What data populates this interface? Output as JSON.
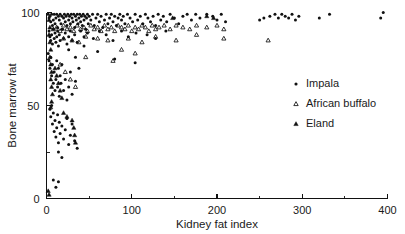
{
  "chart_data": {
    "type": "scatter",
    "title": "",
    "xlabel": "Kidney fat index",
    "ylabel": "Bone marrow fat",
    "xlim": [
      0,
      400
    ],
    "ylim": [
      0,
      100
    ],
    "xticks": [
      0,
      100,
      200,
      300,
      400
    ],
    "yticks": [
      0,
      50,
      100
    ],
    "xtick_labels": [
      "0",
      "100",
      "200",
      "300",
      "400"
    ],
    "ytick_labels": [
      "0",
      "50",
      "100"
    ],
    "x_minor_ticks": [
      50,
      150,
      250,
      350
    ],
    "y_minor_ticks": [
      25,
      75
    ],
    "grid": false,
    "legend_position": "center-right",
    "series": [
      {
        "name": "Impala",
        "marker": "filled-circle",
        "color": "#111111",
        "points": [
          [
            2,
            99
          ],
          [
            3,
            97
          ],
          [
            4,
            98
          ],
          [
            5,
            95
          ],
          [
            6,
            99
          ],
          [
            7,
            93
          ],
          [
            8,
            96
          ],
          [
            9,
            99
          ],
          [
            10,
            94
          ],
          [
            11,
            97
          ],
          [
            12,
            99
          ],
          [
            13,
            92
          ],
          [
            14,
            98
          ],
          [
            15,
            96
          ],
          [
            16,
            99
          ],
          [
            17,
            94
          ],
          [
            18,
            98
          ],
          [
            19,
            91
          ],
          [
            20,
            97
          ],
          [
            21,
            99
          ],
          [
            22,
            95
          ],
          [
            23,
            98
          ],
          [
            24,
            93
          ],
          [
            25,
            99
          ],
          [
            26,
            96
          ],
          [
            27,
            98
          ],
          [
            28,
            94
          ],
          [
            29,
            99
          ],
          [
            30,
            97
          ],
          [
            31,
            95
          ],
          [
            32,
            99
          ],
          [
            33,
            92
          ],
          [
            34,
            98
          ],
          [
            35,
            96
          ],
          [
            36,
            99
          ],
          [
            37,
            94
          ],
          [
            38,
            97
          ],
          [
            39,
            99
          ],
          [
            40,
            95
          ],
          [
            41,
            98
          ],
          [
            42,
            93
          ],
          [
            43,
            99
          ],
          [
            44,
            96
          ],
          [
            45,
            98
          ],
          [
            46,
            91
          ],
          [
            47,
            97
          ],
          [
            48,
            99
          ],
          [
            49,
            94
          ],
          [
            50,
            98
          ],
          [
            52,
            96
          ],
          [
            54,
            99
          ],
          [
            56,
            93
          ],
          [
            58,
            97
          ],
          [
            60,
            99
          ],
          [
            62,
            95
          ],
          [
            64,
            98
          ],
          [
            66,
            92
          ],
          [
            68,
            96
          ],
          [
            70,
            99
          ],
          [
            72,
            94
          ],
          [
            74,
            97
          ],
          [
            76,
            99
          ],
          [
            78,
            95
          ],
          [
            80,
            98
          ],
          [
            82,
            93
          ],
          [
            84,
            97
          ],
          [
            86,
            99
          ],
          [
            88,
            96
          ],
          [
            90,
            98
          ],
          [
            92,
            94
          ],
          [
            95,
            99
          ],
          [
            98,
            97
          ],
          [
            101,
            95
          ],
          [
            104,
            99
          ],
          [
            107,
            96
          ],
          [
            110,
            98
          ],
          [
            113,
            94
          ],
          [
            116,
            99
          ],
          [
            119,
            97
          ],
          [
            122,
            95
          ],
          [
            125,
            98
          ],
          [
            128,
            93
          ],
          [
            131,
            99
          ],
          [
            134,
            96
          ],
          [
            137,
            98
          ],
          [
            141,
            95
          ],
          [
            145,
            99
          ],
          [
            150,
            97
          ],
          [
            155,
            94
          ],
          [
            160,
            98
          ],
          [
            165,
            99
          ],
          [
            170,
            96
          ],
          [
            175,
            99
          ],
          [
            180,
            97
          ],
          [
            188,
            99
          ],
          [
            195,
            98
          ],
          [
            200,
            96
          ],
          [
            205,
            99
          ],
          [
            210,
            95
          ],
          [
            250,
            96
          ],
          [
            255,
            97
          ],
          [
            262,
            98
          ],
          [
            268,
            99
          ],
          [
            272,
            97
          ],
          [
            276,
            99
          ],
          [
            280,
            98
          ],
          [
            284,
            97
          ],
          [
            288,
            99
          ],
          [
            292,
            96
          ],
          [
            296,
            98
          ],
          [
            320,
            97
          ],
          [
            332,
            99
          ],
          [
            392,
            97
          ],
          [
            395,
            100
          ],
          [
            3,
            90
          ],
          [
            4,
            87
          ],
          [
            5,
            85
          ],
          [
            6,
            88
          ],
          [
            7,
            83
          ],
          [
            8,
            91
          ],
          [
            9,
            86
          ],
          [
            10,
            89
          ],
          [
            11,
            84
          ],
          [
            12,
            87
          ],
          [
            13,
            90
          ],
          [
            14,
            82
          ],
          [
            15,
            88
          ],
          [
            16,
            85
          ],
          [
            18,
            91
          ],
          [
            20,
            86
          ],
          [
            22,
            89
          ],
          [
            24,
            83
          ],
          [
            26,
            87
          ],
          [
            28,
            90
          ],
          [
            30,
            85
          ],
          [
            33,
            88
          ],
          [
            36,
            84
          ],
          [
            40,
            90
          ],
          [
            44,
            87
          ],
          [
            48,
            89
          ],
          [
            55,
            86
          ],
          [
            62,
            90
          ],
          [
            70,
            88
          ],
          [
            78,
            85
          ],
          [
            88,
            90
          ],
          [
            96,
            87
          ],
          [
            105,
            89
          ],
          [
            118,
            88
          ],
          [
            128,
            86
          ],
          [
            140,
            90
          ],
          [
            2,
            78
          ],
          [
            3,
            74
          ],
          [
            4,
            70
          ],
          [
            5,
            76
          ],
          [
            6,
            66
          ],
          [
            7,
            72
          ],
          [
            8,
            62
          ],
          [
            9,
            68
          ],
          [
            10,
            58
          ],
          [
            11,
            64
          ],
          [
            12,
            74
          ],
          [
            13,
            60
          ],
          [
            14,
            70
          ],
          [
            15,
            55
          ],
          [
            16,
            66
          ],
          [
            17,
            62
          ],
          [
            18,
            72
          ],
          [
            20,
            58
          ],
          [
            22,
            64
          ],
          [
            24,
            53
          ],
          [
            26,
            60
          ],
          [
            28,
            68
          ],
          [
            30,
            56
          ],
          [
            34,
            63
          ],
          [
            38,
            70
          ],
          [
            26,
            80
          ],
          [
            34,
            76
          ],
          [
            44,
            82
          ],
          [
            60,
            79
          ],
          [
            80,
            75
          ],
          [
            104,
            73
          ],
          [
            4,
            48
          ],
          [
            5,
            44
          ],
          [
            6,
            50
          ],
          [
            7,
            40
          ],
          [
            8,
            46
          ],
          [
            9,
            36
          ],
          [
            10,
            42
          ],
          [
            11,
            33
          ],
          [
            12,
            38
          ],
          [
            13,
            45
          ],
          [
            14,
            30
          ],
          [
            15,
            41
          ],
          [
            16,
            35
          ],
          [
            18,
            39
          ],
          [
            20,
            32
          ],
          [
            22,
            37
          ],
          [
            24,
            43
          ],
          [
            26,
            29
          ],
          [
            28,
            34
          ],
          [
            30,
            40
          ],
          [
            33,
            31
          ],
          [
            36,
            27
          ],
          [
            14,
            25
          ],
          [
            18,
            22
          ],
          [
            8,
            10
          ],
          [
            11,
            6
          ],
          [
            14,
            9
          ]
        ]
      },
      {
        "name": "African buffalo",
        "marker": "open-triangle",
        "color": "#111111",
        "points": [
          [
            8,
            91
          ],
          [
            12,
            92
          ],
          [
            16,
            90
          ],
          [
            20,
            93
          ],
          [
            24,
            91
          ],
          [
            28,
            92
          ],
          [
            32,
            90
          ],
          [
            36,
            93
          ],
          [
            40,
            91
          ],
          [
            44,
            92
          ],
          [
            48,
            90
          ],
          [
            52,
            93
          ],
          [
            56,
            91
          ],
          [
            60,
            92
          ],
          [
            64,
            90
          ],
          [
            68,
            93
          ],
          [
            72,
            91
          ],
          [
            76,
            92
          ],
          [
            80,
            90
          ],
          [
            84,
            93
          ],
          [
            88,
            92
          ],
          [
            92,
            91
          ],
          [
            96,
            93
          ],
          [
            100,
            90
          ],
          [
            104,
            92
          ],
          [
            108,
            91
          ],
          [
            112,
            93
          ],
          [
            116,
            92
          ],
          [
            120,
            90
          ],
          [
            124,
            93
          ],
          [
            128,
            91
          ],
          [
            132,
            92
          ],
          [
            138,
            93
          ],
          [
            145,
            91
          ],
          [
            152,
            93
          ],
          [
            160,
            92
          ],
          [
            168,
            91
          ],
          [
            176,
            93
          ],
          [
            188,
            92
          ],
          [
            200,
            93
          ],
          [
            208,
            91
          ],
          [
            20,
            86
          ],
          [
            30,
            85
          ],
          [
            38,
            84
          ],
          [
            46,
            87
          ],
          [
            60,
            86
          ],
          [
            72,
            85
          ],
          [
            96,
            86
          ],
          [
            112,
            84
          ],
          [
            128,
            87
          ],
          [
            152,
            85
          ],
          [
            176,
            88
          ],
          [
            208,
            86
          ],
          [
            260,
            85
          ],
          [
            16,
            72
          ],
          [
            22,
            68
          ],
          [
            28,
            64
          ],
          [
            34,
            60
          ],
          [
            46,
            76
          ],
          [
            78,
            74
          ],
          [
            88,
            80
          ],
          [
            104,
            78
          ]
        ]
      },
      {
        "name": "Eland",
        "marker": "filled-triangle",
        "color": "#111111",
        "points": [
          [
            3,
            96
          ],
          [
            4,
            92
          ],
          [
            3,
            88
          ],
          [
            4,
            84
          ],
          [
            5,
            80
          ],
          [
            4,
            76
          ],
          [
            5,
            72
          ],
          [
            6,
            68
          ],
          [
            5,
            64
          ],
          [
            6,
            60
          ],
          [
            7,
            56
          ],
          [
            6,
            52
          ],
          [
            5,
            49
          ],
          [
            10,
            70
          ],
          [
            12,
            66
          ],
          [
            14,
            62
          ],
          [
            16,
            58
          ],
          [
            18,
            54
          ],
          [
            20,
            46
          ],
          [
            24,
            44
          ],
          [
            30,
            42
          ],
          [
            32,
            38
          ],
          [
            33,
            34
          ],
          [
            34,
            30
          ],
          [
            2,
            4
          ],
          [
            3,
            2
          ],
          [
            148,
            97
          ],
          [
            188,
            98
          ],
          [
            196,
            97
          ]
        ]
      }
    ]
  },
  "legend": {
    "items": [
      {
        "label": "Impala",
        "marker": "filled-circle"
      },
      {
        "label": "African buffalo",
        "marker": "open-triangle"
      },
      {
        "label": "Eland",
        "marker": "filled-triangle"
      }
    ]
  }
}
